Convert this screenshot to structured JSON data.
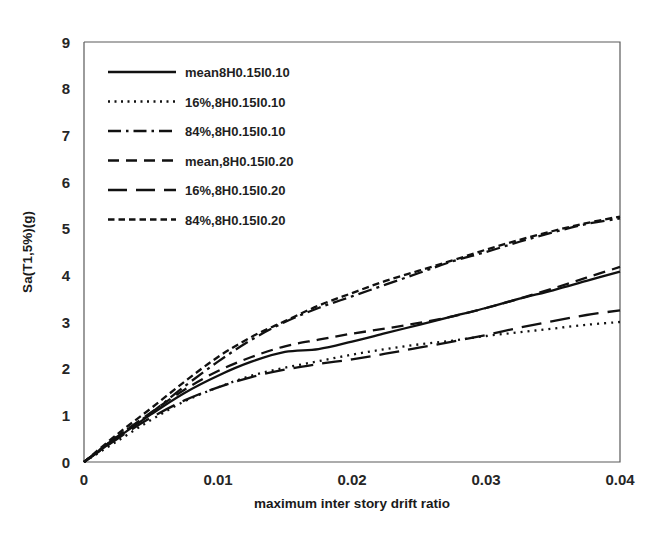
{
  "chart_data": {
    "type": "line",
    "title": "",
    "xlabel": "maximum inter story drift ratio",
    "ylabel": "Sa(T1,5%)(g)",
    "xlim": [
      0,
      0.04
    ],
    "ylim": [
      0,
      9
    ],
    "xticks": [
      "0",
      "0.01",
      "0.02",
      "0.03",
      "0.04"
    ],
    "xtick_values": [
      0,
      0.01,
      0.02,
      0.03,
      0.04
    ],
    "yticks": [
      "0",
      "1",
      "2",
      "3",
      "4",
      "5",
      "6",
      "7",
      "8",
      "9"
    ],
    "ytick_values": [
      0,
      1,
      2,
      3,
      4,
      5,
      6,
      7,
      8,
      9
    ],
    "grid": false,
    "legend_position": "upper-left",
    "x": [
      0,
      0.0025,
      0.005,
      0.0075,
      0.01,
      0.0125,
      0.015,
      0.0175,
      0.02,
      0.0225,
      0.025,
      0.0275,
      0.03,
      0.0325,
      0.035,
      0.0375,
      0.04
    ],
    "series": [
      {
        "name": "mean8H0.15I0.10",
        "style": "solid",
        "dash": "none",
        "values": [
          0,
          0.52,
          1.02,
          1.48,
          1.85,
          2.15,
          2.36,
          2.42,
          2.58,
          2.76,
          2.94,
          3.12,
          3.3,
          3.5,
          3.68,
          3.88,
          4.08
        ]
      },
      {
        "name": "16%,8H0.15I0.10",
        "style": "dotted",
        "dash": "2,5",
        "values": [
          0,
          0.45,
          0.9,
          1.3,
          1.6,
          1.85,
          2.02,
          2.16,
          2.3,
          2.42,
          2.52,
          2.6,
          2.7,
          2.78,
          2.86,
          2.94,
          3.0
        ]
      },
      {
        "name": "84%,8H0.15I0.10",
        "style": "dash-dot",
        "dash": "14,5,3,5",
        "values": [
          0,
          0.55,
          1.05,
          1.62,
          2.15,
          2.62,
          3.0,
          3.3,
          3.55,
          3.8,
          4.05,
          4.3,
          4.5,
          4.72,
          4.92,
          5.1,
          5.22
        ]
      },
      {
        "name": "mean,8H0.15I0.20",
        "style": "dashed",
        "dash": "12,7",
        "values": [
          0,
          0.55,
          1.06,
          1.55,
          1.95,
          2.25,
          2.48,
          2.62,
          2.75,
          2.86,
          2.98,
          3.12,
          3.3,
          3.5,
          3.72,
          3.95,
          4.18
        ]
      },
      {
        "name": "16%,8H0.15I0.20",
        "style": "long-dash",
        "dash": "20,9",
        "values": [
          0,
          0.5,
          0.95,
          1.32,
          1.6,
          1.82,
          1.98,
          2.1,
          2.2,
          2.32,
          2.45,
          2.58,
          2.72,
          2.88,
          3.02,
          3.15,
          3.25
        ]
      },
      {
        "name": "84%,8H0.15I0.20",
        "style": "short-dash",
        "dash": "7,4",
        "values": [
          0,
          0.6,
          1.15,
          1.72,
          2.25,
          2.68,
          3.02,
          3.35,
          3.62,
          3.88,
          4.1,
          4.32,
          4.55,
          4.76,
          4.95,
          5.12,
          5.26
        ]
      }
    ]
  },
  "legend": {
    "items": [
      {
        "label": "mean8H0.15I0.10",
        "dash": "none"
      },
      {
        "label": "16%,8H0.15I0.10",
        "dash": "2,4.5"
      },
      {
        "label": "84%,8H0.15I0.10",
        "dash": "13,5,2.5,5"
      },
      {
        "label": "mean,8H0.15I0.20",
        "dash": "11,7"
      },
      {
        "label": "16%,8H0.15I0.20",
        "dash": "19,9"
      },
      {
        "label": "84%,8H0.15I0.20",
        "dash": "6.5,4"
      }
    ]
  },
  "colors": {
    "line": "#111111",
    "frame": "#5a5a5a",
    "text": "#1a1a1a",
    "background": "#ffffff"
  }
}
